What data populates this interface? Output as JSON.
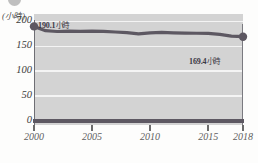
{
  "figure": {
    "background_color": "#fdfdfc",
    "plot_background_color": "#d3d3d3",
    "line_color": "#5d5862",
    "gridline_color": "#f4f4f4",
    "corner_badge_name": "cropped-circle-badge"
  },
  "axes": {
    "y_unit_label": "(小時)",
    "y_ticks": [
      "200",
      "150",
      "100",
      "50",
      "0"
    ],
    "x_ticks": [
      "2000",
      "2005",
      "2010",
      "2015",
      "2018"
    ]
  },
  "annotations": {
    "start": {
      "value": "190.1",
      "unit": "小時"
    },
    "end": {
      "value": "169.4",
      "unit": "小時"
    }
  },
  "chart_data": {
    "type": "line",
    "title": "",
    "subtitle": "",
    "xlabel": "",
    "ylabel": "(小時)",
    "ylim": [
      0,
      215
    ],
    "xlim": [
      2000,
      2018
    ],
    "grid": true,
    "legend": "none",
    "y_tick_values": [
      0,
      50,
      100,
      150,
      200
    ],
    "x_tick_values": [
      2000,
      2005,
      2010,
      2015,
      2018
    ],
    "x": [
      2000,
      2001,
      2002,
      2003,
      2004,
      2005,
      2006,
      2007,
      2008,
      2009,
      2010,
      2011,
      2012,
      2013,
      2014,
      2015,
      2016,
      2017,
      2018
    ],
    "series": [
      {
        "name": "平均工時",
        "unit": "小時",
        "values": [
          190.1,
          181.5,
          179.8,
          180.4,
          180.1,
          180.6,
          180.0,
          178.8,
          177.5,
          175.0,
          177.2,
          178.0,
          177.1,
          176.6,
          176.3,
          175.9,
          174.0,
          170.6,
          169.4
        ],
        "marker_points": [
          {
            "x": 2000,
            "y": 190.1,
            "label": "190.1 小時"
          },
          {
            "x": 2018,
            "y": 169.4,
            "label": "169.4 小時"
          }
        ]
      }
    ]
  }
}
